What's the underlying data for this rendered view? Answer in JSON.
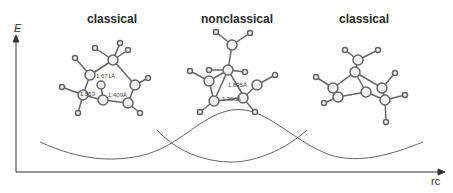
{
  "title_left": "classical",
  "title_center": "nonclassical",
  "title_right": "classical",
  "y_axis_label": "E",
  "x_axis_label": "rc",
  "distances_left": [
    "1.671Å",
    "1.553",
    "1.409Å"
  ],
  "distances_center": [
    "1.835Å",
    "1.396Å"
  ],
  "colors": {
    "curve": "#555555",
    "axis": "#333333",
    "atom": "#f2f2f2",
    "bond": "#666666"
  }
}
